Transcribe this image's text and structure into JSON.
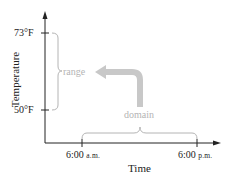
{
  "diagram": {
    "y_axis": {
      "label": "Temperature",
      "ticks": [
        {
          "label": "73°F",
          "y": 33
        },
        {
          "label": "50°F",
          "y": 110
        }
      ]
    },
    "x_axis": {
      "label": "Time",
      "ticks": [
        {
          "label": "6:00",
          "suffix": "a.m.",
          "x": 82
        },
        {
          "label": "6:00",
          "suffix": "p.m.",
          "x": 197
        }
      ]
    },
    "annotations": {
      "range_label": "range",
      "domain_label": "domain"
    },
    "colors": {
      "axis": "#222222",
      "annotation": "#b4b4b4",
      "arrow": "#c8c8c8"
    }
  }
}
